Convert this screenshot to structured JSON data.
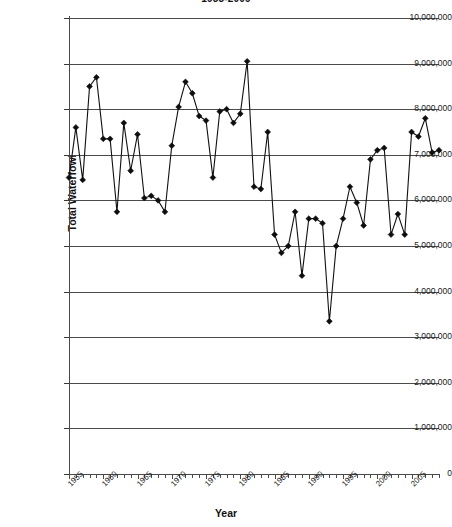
{
  "chart_data": {
    "type": "line",
    "title": "1955-2009",
    "xlabel": "Year",
    "ylabel": "Total Waterfowl",
    "xlim": [
      1955,
      2009
    ],
    "ylim": [
      0,
      10000000
    ],
    "grid": true,
    "legend": false,
    "marker": "diamond",
    "y_ticks": [
      0,
      1000000,
      2000000,
      3000000,
      4000000,
      5000000,
      6000000,
      7000000,
      8000000,
      9000000,
      10000000
    ],
    "y_tick_labels": [
      "0",
      "1,000,000",
      "2,000,000",
      "3,000,000",
      "4,000,000",
      "5,000,000",
      "6,000,000",
      "7,000,000",
      "8,000,000",
      "9,000,000",
      "10,000,000"
    ],
    "x_tick_labels": [
      "1955",
      "1960",
      "1965",
      "1970",
      "1975",
      "1980",
      "1985",
      "1990",
      "1995",
      "2000",
      "2005"
    ],
    "x_tick_label_years": [
      1955,
      1960,
      1965,
      1970,
      1975,
      1980,
      1985,
      1990,
      1995,
      2000,
      2005
    ],
    "x": [
      1955,
      1956,
      1957,
      1958,
      1959,
      1960,
      1961,
      1962,
      1963,
      1964,
      1965,
      1966,
      1967,
      1968,
      1969,
      1970,
      1971,
      1972,
      1973,
      1974,
      1975,
      1976,
      1977,
      1978,
      1979,
      1980,
      1981,
      1982,
      1983,
      1984,
      1985,
      1986,
      1987,
      1988,
      1989,
      1990,
      1991,
      1992,
      1993,
      1994,
      1995,
      1996,
      1997,
      1998,
      1999,
      2000,
      2001,
      2002,
      2003,
      2004,
      2005,
      2006,
      2007,
      2008,
      2009
    ],
    "values": [
      6500000,
      7600000,
      6450000,
      8500000,
      8700000,
      7350000,
      7350000,
      5750000,
      7700000,
      6650000,
      7450000,
      6050000,
      6100000,
      6000000,
      5750000,
      7200000,
      8050000,
      8600000,
      8350000,
      7850000,
      7750000,
      6500000,
      7950000,
      8000000,
      7700000,
      7900000,
      9050000,
      6300000,
      6250000,
      7500000,
      5250000,
      4850000,
      5000000,
      5750000,
      4350000,
      5600000,
      5600000,
      5500000,
      3350000,
      5000000,
      5600000,
      6300000,
      5950000,
      5450000,
      6900000,
      7100000,
      7150000,
      5250000,
      5700000,
      5250000,
      7500000,
      7400000,
      7800000,
      7050000,
      7100000
    ],
    "series_name": "Total Waterfowl"
  },
  "colors": {
    "line": "#111111",
    "marker": "#0d0d0d",
    "grid": "#4a4a4a",
    "axis": "#4a4a4a",
    "text": "#1b1b1b",
    "background": "#ffffff"
  }
}
